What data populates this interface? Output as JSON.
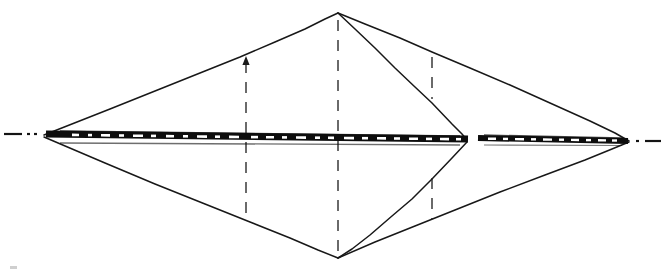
{
  "figure": {
    "caption": "",
    "medium": "pen-and-ink line drawing, scanned",
    "background_color": "#ffffff",
    "ink_color": "#141414",
    "dashed_ink_color": "#3a3a3a",
    "canvas": {
      "width": 663,
      "height": 274
    }
  },
  "vertices": [
    {
      "id": "left-apex",
      "label": "",
      "x": 44,
      "y": 135
    },
    {
      "id": "top-apex",
      "label": "",
      "x": 338,
      "y": 13
    },
    {
      "id": "right-apex",
      "label": "",
      "x": 629,
      "y": 141
    },
    {
      "id": "bottom-apex",
      "label": "",
      "x": 338,
      "y": 258
    },
    {
      "id": "mid-right-vertex",
      "label": "",
      "x": 467,
      "y": 140
    }
  ],
  "solid_edges": [
    {
      "id": "upper-left-edge",
      "from": "left-apex",
      "to": "top-apex",
      "points": "44,135 160,89 240,57 300,30 338,13"
    },
    {
      "id": "upper-right-long-edge",
      "from": "top-apex",
      "to": "right-apex",
      "points": "338,13 430,51 520,88 590,120 629,141"
    },
    {
      "id": "upper-right-steep-edge",
      "from": "top-apex",
      "to": "mid-right-vertex",
      "points": "338,13 390,62 435,106 460,130 467,140"
    },
    {
      "id": "lower-left-edge",
      "from": "left-apex",
      "to": "bottom-apex",
      "points": "44,137 150,182 250,222 310,248 338,258"
    },
    {
      "id": "lower-right-long-edge",
      "from": "bottom-apex",
      "to": "right-apex",
      "points": "338,258 430,218 520,180 590,154 629,142"
    },
    {
      "id": "lower-right-steep-edge",
      "from": "mid-right-vertex",
      "to": "bottom-apex",
      "points": "467,142 440,172 400,208 360,242 338,258"
    }
  ],
  "ink_bands": [
    {
      "id": "horizontal-band-left",
      "x1": 46,
      "y1": 134,
      "x2": 468,
      "y2": 139,
      "thickness": 7
    },
    {
      "id": "horizontal-band-right",
      "x1": 478,
      "y1": 138,
      "x2": 628,
      "y2": 141,
      "thickness": 6
    }
  ],
  "band_gap": {
    "id": "band-gap",
    "x_start": 468,
    "x_end": 478
  },
  "centerline": {
    "id": "dash-dot-centerline",
    "left_segments": [
      {
        "x1": 4,
        "y1": 134,
        "x2": 22,
        "y2": 134
      },
      {
        "x1": 27,
        "y1": 134,
        "x2": 30,
        "y2": 134
      },
      {
        "x1": 34,
        "y1": 134,
        "x2": 37,
        "y2": 134
      }
    ],
    "right_segments": [
      {
        "x1": 636,
        "y1": 141,
        "x2": 639,
        "y2": 141
      },
      {
        "x1": 645,
        "y1": 141,
        "x2": 661,
        "y2": 141
      }
    ]
  },
  "ordinate_lines": [
    {
      "id": "ordinate-1",
      "x": 246,
      "y_top": 58,
      "y_bottom": 218,
      "arrow_at_top": true,
      "split_at_band": false
    },
    {
      "id": "ordinate-2",
      "x": 338,
      "y_top": 20,
      "y_bottom": 252,
      "arrow_at_top": false,
      "split_at_band": false
    },
    {
      "id": "ordinate-3",
      "x": 432,
      "y_top": 57,
      "y_bottom": 219,
      "arrow_at_top": false,
      "split_at_band": true,
      "upper_span": {
        "y_top": 57,
        "y_bottom": 99
      },
      "lower_span": {
        "y_top": 178,
        "y_bottom": 219
      }
    }
  ],
  "arrowheads": [
    {
      "id": "ordinate-1-top-arrow",
      "x": 246,
      "y": 58,
      "direction": "up"
    }
  ],
  "corner_marks": [
    {
      "id": "scan-fleck-bottom-left",
      "x": 10,
      "y": 266,
      "width": 7,
      "height": 3
    }
  ]
}
